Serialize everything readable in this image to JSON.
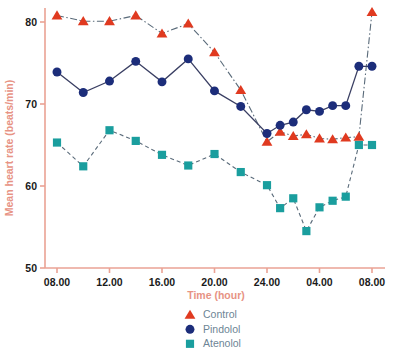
{
  "chart_data": {
    "type": "line",
    "title": "",
    "xlabel": "Time (hour)",
    "ylabel": "Mean heart rate (beats/min)",
    "ylim": [
      50,
      82
    ],
    "yticks": [
      50,
      60,
      70,
      80
    ],
    "ytick_labels": [
      "50",
      "60",
      "70",
      "80"
    ],
    "xticks": [
      8,
      12,
      16,
      20,
      24,
      28,
      32
    ],
    "xtick_labels": [
      "08.00",
      "12.00",
      "16.00",
      "20.00",
      "24.00",
      "04.00",
      "08.00"
    ],
    "grid": false,
    "legend_position": "bottom-center",
    "axis_color": "#eaa294",
    "tick_label_color": "#1a1a1a",
    "axis_title_color": "#e79384",
    "legend_text_color": "#6d8595",
    "series": [
      {
        "name": "Control",
        "color": "#e03a20",
        "marker": "triangle",
        "linestyle": "dashdot",
        "x": [
          8,
          10,
          12,
          14,
          16,
          18,
          20,
          22,
          24,
          25,
          26,
          27,
          28,
          29,
          30,
          31,
          32
        ],
        "values": [
          80.8,
          80.1,
          80.1,
          80.8,
          78.6,
          79.8,
          76.3,
          71.7,
          65.4,
          66.6,
          66.1,
          66.3,
          65.8,
          65.7,
          65.9,
          66.0,
          81.2
        ]
      },
      {
        "name": "Pindolol",
        "color": "#1c2d7a",
        "marker": "circle",
        "linestyle": "solid",
        "x": [
          8,
          10,
          12,
          14,
          16,
          18,
          20,
          22,
          24,
          25,
          26,
          27,
          28,
          29,
          30,
          31,
          32
        ],
        "values": [
          73.9,
          71.4,
          72.8,
          75.2,
          72.7,
          75.5,
          71.6,
          69.7,
          66.4,
          67.4,
          67.8,
          69.3,
          69.1,
          69.8,
          69.8,
          74.6,
          74.6
        ]
      },
      {
        "name": "Atenolol",
        "color": "#1a9e9e",
        "marker": "square",
        "linestyle": "dashed",
        "x": [
          8,
          10,
          12,
          14,
          16,
          18,
          20,
          22,
          24,
          25,
          26,
          27,
          28,
          29,
          30,
          31,
          32
        ],
        "values": [
          65.3,
          62.4,
          66.8,
          65.5,
          63.8,
          62.5,
          63.9,
          61.7,
          60.1,
          57.3,
          58.5,
          54.5,
          57.4,
          58.2,
          58.7,
          65.0,
          65.0
        ]
      }
    ]
  },
  "legend": {
    "items": [
      {
        "label": "Control",
        "marker": "triangle",
        "color": "#e03a20"
      },
      {
        "label": "Pindolol",
        "marker": "circle",
        "color": "#1c2d7a"
      },
      {
        "label": "Atenolol",
        "marker": "square",
        "color": "#1a9e9e"
      }
    ]
  }
}
